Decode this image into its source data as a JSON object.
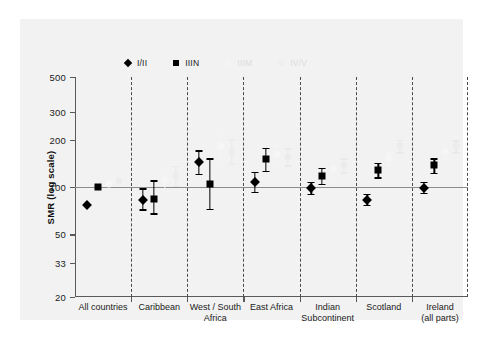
{
  "chart_data": {
    "type": "scatter",
    "title": "",
    "xlabel": "",
    "ylabel": "SMR (log scale)",
    "yscale": "log",
    "ylim": [
      20,
      500
    ],
    "yticks": [
      500,
      300,
      200,
      100,
      50,
      33,
      20
    ],
    "ytick_labels": [
      "500",
      "300",
      "200",
      "100",
      "50",
      "33",
      "20"
    ],
    "reference_line": 100,
    "grid": false,
    "legend_position": "top",
    "categories": [
      "All countries",
      "Caribbean",
      "West / South Africa",
      "East Africa",
      "Indian Subcontinent",
      "Scotland",
      "Ireland (all parts)"
    ],
    "category_lines": [
      [
        "All countries"
      ],
      [
        "Caribbean"
      ],
      [
        "West / South",
        "Africa"
      ],
      [
        "East Africa"
      ],
      [
        "Indian",
        "Subcontinent"
      ],
      [
        "Scotland"
      ],
      [
        "Ireland",
        "(all parts)"
      ]
    ],
    "series": [
      {
        "name": "I/II",
        "marker": "diamond",
        "color": "#000000",
        "values": [
          77,
          83,
          145,
          107,
          99,
          83,
          99
        ],
        "ci_low": [
          77,
          72,
          121,
          93,
          90,
          77,
          92
        ],
        "ci_high": [
          77,
          98,
          171,
          125,
          108,
          90,
          108
        ]
      },
      {
        "name": "IIIN",
        "marker": "square",
        "color": "#000000",
        "values": [
          100,
          84,
          105,
          150,
          118,
          128,
          137
        ],
        "ci_low": [
          100,
          68,
          73,
          127,
          105,
          115,
          123
        ],
        "ci_high": [
          100,
          110,
          152,
          178,
          133,
          143,
          152
        ]
      },
      {
        "name": "IIIM",
        "marker": "circle",
        "color": "#f5f5f5",
        "values": [
          104,
          110,
          183,
          162,
          131,
          152,
          168
        ],
        "ci_low": [
          104,
          95,
          150,
          142,
          118,
          138,
          152
        ],
        "ci_high": [
          104,
          127,
          223,
          185,
          146,
          168,
          186
        ]
      },
      {
        "name": "IV/V",
        "marker": "circle",
        "color": "#ededed",
        "values": [
          109,
          118,
          168,
          155,
          137,
          182,
          181
        ],
        "ci_low": [
          109,
          102,
          140,
          137,
          124,
          166,
          166
        ],
        "ci_high": [
          109,
          136,
          202,
          176,
          152,
          200,
          198
        ]
      }
    ]
  },
  "legend": {
    "items": [
      {
        "label": "I/II",
        "marker": "diamond"
      },
      {
        "label": "IIIN",
        "marker": "square"
      },
      {
        "label": "IIIM",
        "marker": "circle-faint"
      },
      {
        "label": "IV/V",
        "marker": "circle-faint2"
      }
    ]
  }
}
